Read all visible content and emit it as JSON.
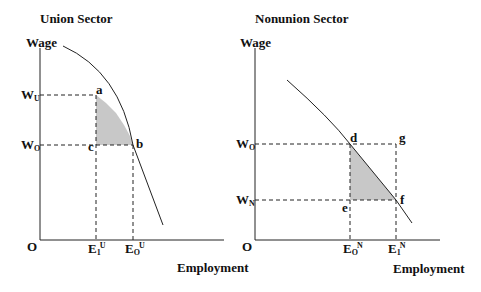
{
  "union": {
    "title": "Union Sector",
    "y_axis_label": "Wage",
    "x_axis_label": "Employment",
    "origin": "O",
    "wage_labels": [
      {
        "main": "W",
        "sub": "U"
      },
      {
        "main": "W",
        "sub": "O"
      }
    ],
    "employment_labels": [
      {
        "main": "E",
        "sub": "1",
        "sup": "U"
      },
      {
        "main": "E",
        "sub": "O",
        "sup": "U"
      }
    ],
    "points": [
      "a",
      "b",
      "c"
    ]
  },
  "nonunion": {
    "title": "Nonunion Sector",
    "y_axis_label": "Wage",
    "x_axis_label": "Employment",
    "origin": "O",
    "wage_labels": [
      {
        "main": "W",
        "sub": "O"
      },
      {
        "main": "W",
        "sub": "N"
      }
    ],
    "employment_labels": [
      {
        "main": "E",
        "sub": "O",
        "sup": "N"
      },
      {
        "main": "E",
        "sub": "1",
        "sup": "N"
      }
    ],
    "points": [
      "d",
      "g",
      "e",
      "f"
    ]
  },
  "colors": {
    "line": "#222222",
    "shade": "#c8c8c8"
  }
}
